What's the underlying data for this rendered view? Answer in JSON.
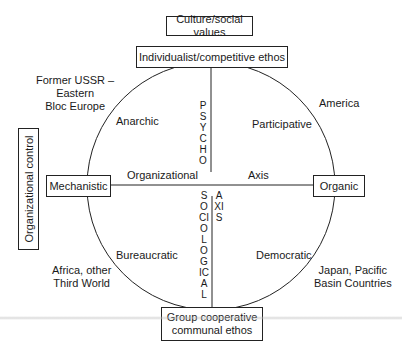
{
  "title_box": "Culture/social values",
  "top_pole": "Individualist/competitive ethos",
  "bottom_pole": {
    "line1": "Group cooperative",
    "line2": "communal ethos"
  },
  "side_box": "Organizational control",
  "left_pole": "Mechanistic",
  "right_pole": "Organic",
  "horizontal_axis": {
    "left_label": "Organizational",
    "right_label": "Axis"
  },
  "vertical_axis": {
    "upper_label": "PSYCHO",
    "lower_label": "SOCIOLOGICAL",
    "lower_axis_label": "AXIS"
  },
  "quadrants": {
    "top_left": "Anarchic",
    "top_right": "Participative",
    "bottom_left": "Bureaucratic",
    "bottom_right": "Democratic"
  },
  "regions": {
    "top_left": {
      "line1": "Former USSR –",
      "line2": "Eastern",
      "line3": "Bloc Europe"
    },
    "top_right": "America",
    "bottom_left": {
      "line1": "Africa, other",
      "line2": "Third World"
    },
    "bottom_right": {
      "line1": "Japan, Pacific",
      "line2": "Basin Countries"
    }
  },
  "colors": {
    "line": "#222222",
    "background": "#ffffff"
  }
}
